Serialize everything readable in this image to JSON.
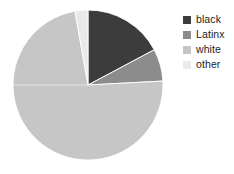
{
  "chart_data": {
    "type": "pie",
    "title": "",
    "xlabel": "",
    "ylabel": "",
    "legend_position": "right",
    "grid": false,
    "start_angle_deg": 0,
    "direction": "clockwise",
    "center": {
      "x": 88,
      "y": 85
    },
    "radius": 75,
    "categories": [
      "black",
      "Latinx",
      "white",
      "other"
    ],
    "values": [
      17.2,
      6.9,
      73.1,
      2.8
    ],
    "value_unit": "percent",
    "angles_deg": [
      62,
      25,
      263,
      10
    ],
    "colors": [
      "#3c3c3c",
      "#8c8c8c",
      "#c6c6c6",
      "#e9e9e9"
    ],
    "slices": [
      {
        "label": "black",
        "value": 17.2,
        "angle_deg": 62,
        "color": "#3c3c3c"
      },
      {
        "label": "Latinx",
        "value": 6.9,
        "angle_deg": 25,
        "color": "#8c8c8c"
      },
      {
        "label": "white",
        "value": 73.1,
        "angle_deg": 263,
        "color": "#c6c6c6"
      },
      {
        "label": "other",
        "value": 2.8,
        "angle_deg": 10,
        "color": "#e9e9e9"
      }
    ]
  },
  "legend": {
    "items": [
      {
        "label": "black",
        "color": "#3c3c3c"
      },
      {
        "label": "Latinx",
        "color": "#8c8c8c"
      },
      {
        "label": "white",
        "color": "#c6c6c6"
      },
      {
        "label": "other",
        "color": "#e9e9e9"
      }
    ]
  },
  "background_color": "#ffffff"
}
